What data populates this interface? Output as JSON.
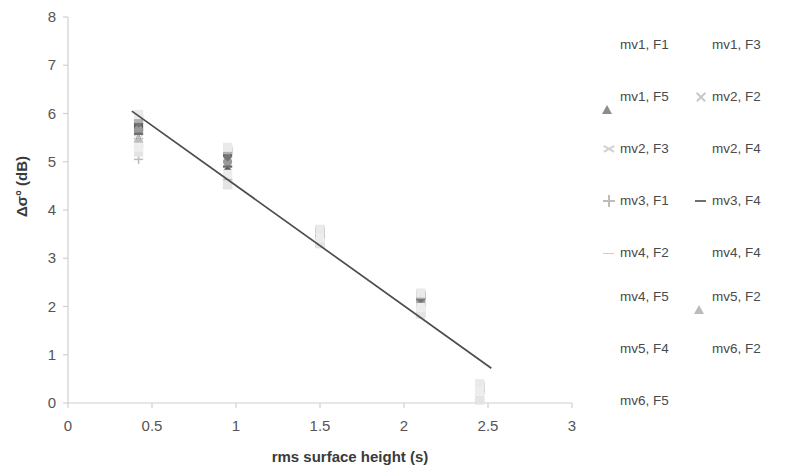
{
  "chart_data": {
    "type": "scatter",
    "title": "",
    "xlabel": "rms surface height (s)",
    "ylabel": "Δσ° (dB)",
    "xlim": [
      0,
      3
    ],
    "ylim": [
      0,
      8
    ],
    "xticks": [
      "0",
      "0.5",
      "1",
      "1.5",
      "2",
      "2.5",
      "3"
    ],
    "xtick_values": [
      0,
      0.5,
      1,
      1.5,
      2,
      2.5,
      3
    ],
    "yticks": [
      "0",
      "1",
      "2",
      "3",
      "4",
      "5",
      "6",
      "7",
      "8"
    ],
    "ytick_values": [
      0,
      1,
      2,
      3,
      4,
      5,
      6,
      7,
      8
    ],
    "grid": false,
    "legend_position": "right",
    "trendline": {
      "x": [
        0.38,
        2.52
      ],
      "y": [
        6.05,
        0.72
      ]
    },
    "series": [
      {
        "name": "mv1, F1",
        "marker": "diamond",
        "color": "#595959",
        "x": [
          0.42,
          0.95,
          1.5,
          2.1,
          2.45
        ],
        "y": [
          5.62,
          4.82,
          3.4,
          2.02,
          0.2
        ]
      },
      {
        "name": "mv1, F3",
        "marker": "square",
        "color": "#5e5e5e",
        "x": [
          0.42,
          0.95,
          1.5,
          2.1,
          2.45
        ],
        "y": [
          5.72,
          5.2,
          3.52,
          2.22,
          0.32
        ]
      },
      {
        "name": "mv1, F5",
        "marker": "triangle",
        "color": "#8c8c8c",
        "x": [
          0.42,
          0.95,
          1.5,
          2.1,
          2.45
        ],
        "y": [
          5.5,
          4.7,
          3.45,
          1.95,
          0.14
        ]
      },
      {
        "name": "mv2, F2",
        "marker": "cross",
        "color": "#c8c8c8",
        "x": [
          0.42,
          0.95,
          1.5,
          2.1,
          2.45
        ],
        "y": [
          5.4,
          4.55,
          3.32,
          1.88,
          0.1
        ]
      },
      {
        "name": "mv2, F3",
        "marker": "star",
        "color": "#d2d2d2",
        "x": [
          0.42,
          0.95,
          1.5,
          2.1,
          2.45
        ],
        "y": [
          5.48,
          4.62,
          3.38,
          1.92,
          0.16
        ]
      },
      {
        "name": "mv2, F4",
        "marker": "circle",
        "color": "#9a9a9a",
        "x": [
          0.42,
          0.95,
          1.5,
          2.1,
          2.45
        ],
        "y": [
          5.66,
          5.0,
          3.5,
          2.1,
          0.26
        ]
      },
      {
        "name": "mv3, F1",
        "marker": "plus",
        "color": "#bdbdbd",
        "x": [
          0.42,
          0.95,
          1.5,
          2.1,
          2.45
        ],
        "y": [
          5.05,
          4.58,
          3.35,
          1.9,
          0.08
        ]
      },
      {
        "name": "mv3, F4",
        "marker": "dash",
        "color": "#6f6f6f",
        "x": [
          0.42,
          0.95,
          1.5,
          2.1,
          2.45
        ],
        "y": [
          5.58,
          4.9,
          3.46,
          2.05,
          0.22
        ]
      },
      {
        "name": "mv4, F2",
        "marker": "line",
        "color": "#cdcdcd",
        "x": [
          0.42,
          0.95,
          1.5,
          2.1,
          2.45
        ],
        "y": [
          5.35,
          4.6,
          3.34,
          1.86,
          0.12
        ]
      },
      {
        "name": "mv4, F4",
        "marker": "diamond",
        "color": "#747474",
        "x": [
          0.42,
          0.95,
          1.5,
          2.1,
          2.45
        ],
        "y": [
          5.8,
          5.1,
          3.55,
          2.16,
          0.3
        ]
      },
      {
        "name": "mv4, F5",
        "marker": "square",
        "color": "#b0b0b0",
        "x": [
          0.42,
          0.95,
          1.5,
          2.1,
          2.45
        ],
        "y": [
          5.9,
          5.25,
          3.58,
          2.25,
          0.36
        ]
      },
      {
        "name": "mv5, F2",
        "marker": "triangle",
        "color": "#bcbcbc",
        "x": [
          0.42,
          0.95,
          1.5,
          2.1,
          2.45
        ],
        "y": [
          5.45,
          4.66,
          3.36,
          1.94,
          0.18
        ]
      },
      {
        "name": "mv5, F4",
        "marker": "blank",
        "color": "#eaeaea",
        "x": [
          0.42,
          0.95,
          1.5,
          2.1,
          2.45
        ],
        "y": [
          5.98,
          5.3,
          3.6,
          2.28,
          0.4
        ]
      },
      {
        "name": "mv6, F2",
        "marker": "blank",
        "color": "#e4e4e4",
        "x": [
          0.42,
          0.95,
          1.5,
          2.1,
          2.45
        ],
        "y": [
          5.2,
          4.52,
          3.3,
          1.84,
          0.06
        ]
      },
      {
        "name": "mv6, F5",
        "marker": "blank",
        "color": "#ededed",
        "x": [
          0.42,
          0.95,
          1.5,
          2.1,
          2.45
        ],
        "y": [
          5.3,
          4.74,
          3.42,
          1.98,
          0.24
        ]
      }
    ]
  },
  "axis": {
    "line_color": "#d0d0d0",
    "trendline_color": "#4d4d4d"
  }
}
